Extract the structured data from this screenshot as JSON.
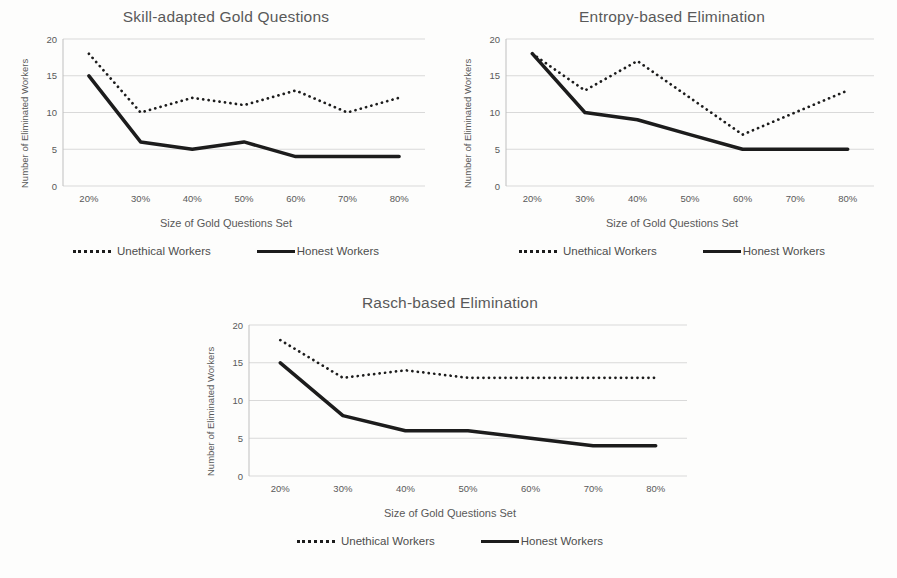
{
  "figure": {
    "background": "#fdfdfc"
  },
  "colors": {
    "grid": "#d9d9d9",
    "axis": "#bfbfbf",
    "tick_text": "#595959",
    "title_text": "#595959",
    "legend_text": "#4d4d4d",
    "series_line": "#1c1c1c"
  },
  "chart_data": [
    {
      "type": "line",
      "title": "Skill-adapted Gold Questions",
      "xlabel": "Size of Gold Questions Set",
      "ylabel": "Number of Eliminated Workers",
      "categories": [
        "20%",
        "30%",
        "40%",
        "50%",
        "60%",
        "70%",
        "80%"
      ],
      "y_ticks": [
        0,
        5,
        10,
        15,
        20
      ],
      "ylim": [
        0,
        20
      ],
      "grid": true,
      "legend_position": "bottom",
      "series": [
        {
          "name": "Unethical Workers",
          "style": "dotted",
          "color": "#1c1c1c",
          "values": [
            18,
            10,
            12,
            11,
            13,
            10,
            12
          ]
        },
        {
          "name": "Honest Workers",
          "style": "solid",
          "color": "#1c1c1c",
          "values": [
            15,
            6,
            5,
            6,
            4,
            4,
            4
          ]
        }
      ]
    },
    {
      "type": "line",
      "title": "Entropy-based Elimination",
      "xlabel": "Size of Gold Questions Set",
      "ylabel": "Number of Eliminated Workers",
      "categories": [
        "20%",
        "30%",
        "40%",
        "50%",
        "60%",
        "70%",
        "80%"
      ],
      "y_ticks": [
        0,
        5,
        10,
        15,
        20
      ],
      "ylim": [
        0,
        20
      ],
      "grid": true,
      "legend_position": "bottom",
      "series": [
        {
          "name": "Unethical Workers",
          "style": "dotted",
          "color": "#1c1c1c",
          "values": [
            18,
            13,
            17,
            12,
            7,
            10,
            13
          ]
        },
        {
          "name": "Honest Workers",
          "style": "solid",
          "color": "#1c1c1c",
          "values": [
            18,
            10,
            9,
            7,
            5,
            5,
            5
          ]
        }
      ]
    },
    {
      "type": "line",
      "title": "Rasch-based Elimination",
      "xlabel": "Size of Gold Questions Set",
      "ylabel": "Number of Eliminated Workers",
      "categories": [
        "20%",
        "30%",
        "40%",
        "50%",
        "60%",
        "70%",
        "80%"
      ],
      "y_ticks": [
        0,
        5,
        10,
        15,
        20
      ],
      "ylim": [
        0,
        20
      ],
      "grid": true,
      "legend_position": "bottom",
      "series": [
        {
          "name": "Unethical Workers",
          "style": "dotted",
          "color": "#1c1c1c",
          "values": [
            18,
            13,
            14,
            13,
            13,
            13,
            13
          ]
        },
        {
          "name": "Honest Workers",
          "style": "solid",
          "color": "#1c1c1c",
          "values": [
            15,
            8,
            6,
            6,
            5,
            4,
            4
          ]
        }
      ]
    }
  ]
}
